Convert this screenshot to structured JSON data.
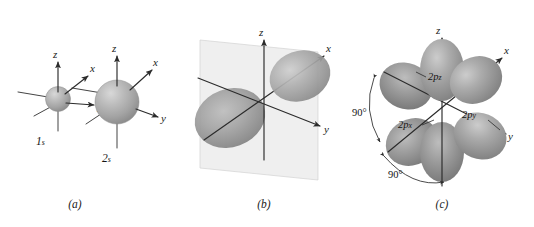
{
  "figure": {
    "background_color": "#ffffff"
  },
  "colors": {
    "orbital_fill": "#9a9a9a",
    "orbital_light": "#c9c9c9",
    "orbital_dark": "#6f6f6f",
    "sphere_fill": "#b0b0b0",
    "nodal_plane": "#e4e4e4",
    "axis_stroke": "#2b2b2b",
    "text": "#141414"
  },
  "panels": [
    {
      "id": "a",
      "caption": "(a)",
      "orbitals": [
        {
          "label": "1s",
          "label_main": "1",
          "label_sub": "s",
          "shape": "sphere",
          "axes": [
            "z",
            "x",
            "y"
          ]
        },
        {
          "label": "2s",
          "label_main": "2",
          "label_sub": "s",
          "shape": "sphere",
          "axes": [
            "z",
            "x",
            "y"
          ]
        }
      ]
    },
    {
      "id": "b",
      "caption": "(b)",
      "orbitals": [
        {
          "label": "",
          "shape": "dumbbell",
          "orientation": "x",
          "nodal_plane": "yz",
          "axes": [
            "z",
            "x",
            "y"
          ]
        }
      ]
    },
    {
      "id": "c",
      "caption": "(c)",
      "orbitals": [
        {
          "label_main": "2p",
          "label_sub": "z",
          "shape": "dumbbell",
          "orientation": "z"
        },
        {
          "label_main": "2p",
          "label_sub": "x",
          "shape": "dumbbell",
          "orientation": "x"
        },
        {
          "label_main": "2p",
          "label_sub": "y",
          "shape": "dumbbell",
          "orientation": "y"
        }
      ],
      "annotations": [
        {
          "text": "90°",
          "position": "upper-left"
        },
        {
          "text": "90°",
          "position": "lower-left"
        }
      ],
      "axes": [
        "z",
        "x",
        "y"
      ]
    }
  ],
  "axis_labels": {
    "x": "x",
    "y": "y",
    "z": "z"
  },
  "labels": {
    "one_s": "1s",
    "two_s": "2s",
    "two_p_z": "2pz",
    "two_p_x": "2px",
    "two_p_y": "2py",
    "angle_upper": "90°",
    "angle_lower": "90°",
    "caption_a": "(a)",
    "caption_b": "(b)",
    "caption_c": "(c)"
  }
}
